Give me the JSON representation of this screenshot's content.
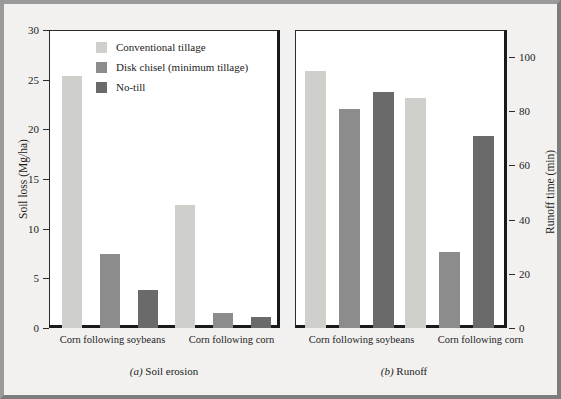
{
  "figure": {
    "background_color": "#f2f1ef",
    "border_color": "#8a8a8a"
  },
  "legend": {
    "position": "top-left-inside-panel-a",
    "items": [
      {
        "label": "Conventional tillage",
        "color": "#cfcfcb"
      },
      {
        "label": "Disk chisel (minimum tillage)",
        "color": "#8c8c8c"
      },
      {
        "label": "No-till",
        "color": "#6a6a6a"
      }
    ]
  },
  "panel_a": {
    "caption_prefix": "(a)",
    "caption_text": "Soil erosion",
    "ylabel": "Soil loss (Mg/ha)",
    "yticks": [
      "0",
      "5",
      "10",
      "15",
      "20",
      "25",
      "30"
    ],
    "categories": [
      "Corn following soybeans",
      "Corn following corn"
    ]
  },
  "panel_b": {
    "caption_prefix": "(b)",
    "caption_text": "Runoff",
    "ylabel": "Runoff time (min)",
    "yticks": [
      "0",
      "20",
      "40",
      "60",
      "80",
      "100"
    ],
    "categories": [
      "Corn following soybeans",
      "Corn following corn"
    ]
  },
  "chart_data": [
    {
      "id": "panel_a",
      "type": "bar",
      "title": "(a) Soil erosion",
      "xlabel": "",
      "ylabel": "Soil loss (Mg/ha)",
      "ylim": [
        0,
        30
      ],
      "ytick_values": [
        0,
        5,
        10,
        15,
        20,
        25,
        30
      ],
      "grid": false,
      "legend_position": "upper-center",
      "categories": [
        "Corn following soybeans",
        "Corn following corn"
      ],
      "series": [
        {
          "name": "Conventional tillage",
          "color": "#cfcfcb",
          "values": [
            25.4,
            12.4
          ]
        },
        {
          "name": "Disk chisel (minimum tillage)",
          "color": "#8c8c8c",
          "values": [
            7.4,
            1.5
          ]
        },
        {
          "name": "No-till",
          "color": "#6a6a6a",
          "values": [
            3.8,
            1.1
          ]
        }
      ]
    },
    {
      "id": "panel_b",
      "type": "bar",
      "title": "(b) Runoff",
      "xlabel": "",
      "ylabel": "Runoff time (min)",
      "ylim": [
        0,
        110
      ],
      "ytick_values": [
        0,
        20,
        40,
        60,
        80,
        100
      ],
      "grid": false,
      "legend_position": "none",
      "yaxis_side": "right",
      "categories": [
        "Corn following soybeans",
        "Corn following corn"
      ],
      "series": [
        {
          "name": "Conventional tillage",
          "color": "#cfcfcb",
          "values": [
            95,
            85
          ]
        },
        {
          "name": "Disk chisel (minimum tillage)",
          "color": "#8c8c8c",
          "values": [
            81,
            28
          ]
        },
        {
          "name": "No-till",
          "color": "#6a6a6a",
          "values": [
            87,
            71
          ]
        }
      ]
    }
  ]
}
